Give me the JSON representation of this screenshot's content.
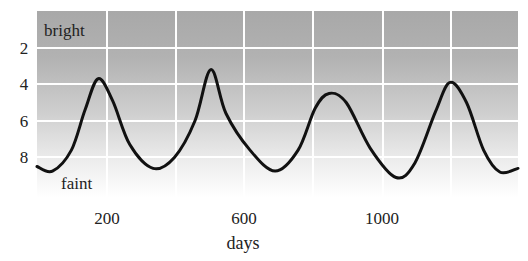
{
  "chart_data": {
    "type": "line",
    "title": "",
    "xlabel": "days",
    "ylabel": "",
    "xlim": [
      0,
      1400
    ],
    "ylim": [
      10,
      0
    ],
    "y_inverted": true,
    "grid": true,
    "legend": null,
    "x_ticks": [
      200,
      600,
      1000
    ],
    "x_gridlines": [
      200,
      400,
      600,
      800,
      1000,
      1200
    ],
    "y_ticks": [
      2,
      4,
      6,
      8
    ],
    "annotations": [
      {
        "text": "bright",
        "position": "top-left"
      },
      {
        "text": "faint",
        "position": "bottom-left"
      }
    ],
    "series": [
      {
        "name": "brightness (magnitude)",
        "x": [
          0,
          45,
          100,
          140,
          178,
          220,
          270,
          338,
          400,
          460,
          506,
          550,
          620,
          693,
          760,
          810,
          850,
          900,
          970,
          1045,
          1100,
          1160,
          1202,
          1250,
          1300,
          1347,
          1400
        ],
        "y": [
          8.5,
          8.75,
          7.6,
          5.4,
          3.7,
          4.9,
          7.3,
          8.6,
          8.0,
          6.0,
          3.2,
          5.6,
          7.6,
          8.75,
          7.6,
          5.3,
          4.5,
          5.0,
          7.5,
          9.1,
          8.3,
          5.5,
          3.9,
          5.0,
          7.6,
          8.8,
          8.6
        ]
      }
    ]
  },
  "labels": {
    "bright": "bright",
    "faint": "faint",
    "xlabel": "days",
    "xtick_200": "200",
    "xtick_600": "600",
    "xtick_1000": "1000",
    "ytick_2": "2",
    "ytick_4": "4",
    "ytick_6": "6",
    "ytick_8": "8"
  },
  "colors": {
    "bg_top": "#a8a8a8",
    "bg_bottom": "#ffffff",
    "grid": "#ffffff",
    "line": "#111111"
  }
}
